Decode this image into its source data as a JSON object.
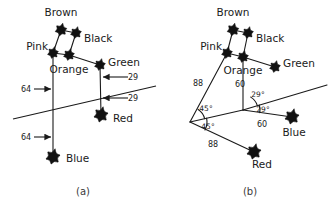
{
  "figure": {
    "panels": [
      {
        "id": "a",
        "caption": "(a)",
        "caption_x": 83,
        "caption_y": 195,
        "nodes": [
          {
            "name": "Brown",
            "x": 61,
            "y": 30,
            "size": 7.0,
            "label": "Brown",
            "label_x": 61,
            "label_y": 16,
            "anchor": "middle"
          },
          {
            "name": "Black",
            "x": 76,
            "y": 33,
            "size": 6.5,
            "label": "Black",
            "label_x": 84,
            "label_y": 42,
            "anchor": "start"
          },
          {
            "name": "Pink",
            "x": 53,
            "y": 53,
            "size": 6.5,
            "label": "Pink",
            "label_x": 48,
            "label_y": 50,
            "anchor": "end"
          },
          {
            "name": "Orange",
            "x": 69,
            "y": 55,
            "size": 6.5,
            "label": "Orange",
            "label_x": 69,
            "label_y": 73,
            "anchor": "middle"
          },
          {
            "name": "Green",
            "x": 100,
            "y": 65,
            "size": 6.5,
            "label": "Green",
            "label_x": 108,
            "label_y": 66,
            "anchor": "start"
          },
          {
            "name": "Red",
            "x": 101,
            "y": 115,
            "size": 8.5,
            "label": "Red",
            "label_x": 113,
            "label_y": 122,
            "anchor": "start"
          },
          {
            "name": "Blue",
            "x": 53,
            "y": 157,
            "size": 8.5,
            "label": "Blue",
            "label_x": 66,
            "label_y": 162,
            "anchor": "start"
          }
        ],
        "edges": [
          {
            "from": "Brown",
            "to": "Black"
          },
          {
            "from": "Brown",
            "to": "Pink"
          },
          {
            "from": "Black",
            "to": "Orange"
          },
          {
            "from": "Pink",
            "to": "Orange"
          },
          {
            "from": "Orange",
            "to": "Green"
          },
          {
            "from": "Pink",
            "to": "Blue"
          },
          {
            "from": "Green",
            "to": "Red"
          }
        ],
        "slant_line": {
          "x1": 13,
          "y1": 119,
          "x2": 156,
          "y2": 86
        },
        "dimensions": [
          {
            "value": "64",
            "text_x": 26,
            "text_y": 92,
            "arrow_x1": 34,
            "arrow_y1": 89,
            "arrow_x2": 51,
            "arrow_y2": 89,
            "dir": "right"
          },
          {
            "value": "64",
            "text_x": 26,
            "text_y": 140,
            "arrow_x1": 34,
            "arrow_y1": 137,
            "arrow_x2": 51,
            "arrow_y2": 137,
            "dir": "right"
          },
          {
            "value": "29",
            "text_x": 133,
            "text_y": 80,
            "arrow_x1": 128,
            "arrow_y1": 77,
            "arrow_x2": 103,
            "arrow_y2": 77,
            "dir": "left"
          },
          {
            "value": "29",
            "text_x": 133,
            "text_y": 101,
            "arrow_x1": 128,
            "arrow_y1": 98,
            "arrow_x2": 103,
            "arrow_y2": 98,
            "dir": "left"
          }
        ],
        "angles": []
      },
      {
        "id": "b",
        "caption": "(b)",
        "caption_x": 250,
        "caption_y": 195,
        "nodes": [
          {
            "name": "Brown",
            "x": 233,
            "y": 30,
            "size": 7.0,
            "label": "Brown",
            "label_x": 233,
            "label_y": 16,
            "anchor": "middle"
          },
          {
            "name": "Black",
            "x": 248,
            "y": 33,
            "size": 6.5,
            "label": "Black",
            "label_x": 256,
            "label_y": 42,
            "anchor": "start"
          },
          {
            "name": "Pink",
            "x": 227,
            "y": 53,
            "size": 6.5,
            "label": "Pink",
            "label_x": 222,
            "label_y": 50,
            "anchor": "end"
          },
          {
            "name": "Orange",
            "x": 243,
            "y": 57,
            "size": 6.5,
            "label": "Orange",
            "label_x": 243,
            "label_y": 74,
            "anchor": "middle"
          },
          {
            "name": "Green",
            "x": 275,
            "y": 67,
            "size": 6.5,
            "label": "Green",
            "label_x": 283,
            "label_y": 67,
            "anchor": "start"
          },
          {
            "name": "Blue",
            "x": 292,
            "y": 117,
            "size": 8.5,
            "label": "Blue",
            "label_x": 294,
            "label_y": 136,
            "anchor": "middle"
          },
          {
            "name": "Red",
            "x": 254,
            "y": 152,
            "size": 8.5,
            "label": "Red",
            "label_x": 262,
            "label_y": 168,
            "anchor": "middle"
          }
        ],
        "edges": [
          {
            "from": "Brown",
            "to": "Black"
          },
          {
            "from": "Brown",
            "to": "Pink"
          },
          {
            "from": "Black",
            "to": "Orange"
          },
          {
            "from": "Pink",
            "to": "Orange"
          },
          {
            "from": "Orange",
            "to": "Green"
          }
        ],
        "vertices": {
          "apex": {
            "x": 190,
            "y": 122
          },
          "mid": {
            "x": 243,
            "y": 110
          }
        },
        "rays": [
          {
            "from": "apex",
            "to_node": "Pink"
          },
          {
            "from": "apex",
            "to_node": "Red"
          },
          {
            "from": "apex",
            "to_point": {
              "x": 243,
              "y": 110
            }
          },
          {
            "from": "mid",
            "to_node": "Orange"
          },
          {
            "from": "mid",
            "to_node": "Blue"
          },
          {
            "from": "mid",
            "to_point": {
              "x": 327,
              "y": 85
            }
          }
        ],
        "dimensions": [
          {
            "value": "88",
            "text_x": 198,
            "text_y": 86
          },
          {
            "value": "88",
            "text_x": 213,
            "text_y": 147
          },
          {
            "value": "60",
            "text_x": 240,
            "text_y": 87
          },
          {
            "value": "60",
            "text_x": 262,
            "text_y": 127
          }
        ],
        "angles": [
          {
            "value": "45°",
            "text_x": 206,
            "text_y": 111,
            "arc_cx": 190,
            "arc_cy": 122,
            "arc_r": 15,
            "a1": -57,
            "a2": -13
          },
          {
            "value": "45°",
            "text_x": 208,
            "text_y": 129,
            "arc_cx": 190,
            "arc_cy": 122,
            "arc_r": 17,
            "a1": -13,
            "a2": 28
          },
          {
            "value": "29°",
            "text_x": 258,
            "text_y": 97,
            "arc_cx": 243,
            "arc_cy": 110,
            "arc_r": 15,
            "a1": -59,
            "a2": -17
          },
          {
            "value": "29°",
            "text_x": 263,
            "text_y": 112,
            "arc_cx": 243,
            "arc_cy": 110,
            "arc_r": 17,
            "a1": -17,
            "a2": 9
          }
        ]
      }
    ]
  }
}
